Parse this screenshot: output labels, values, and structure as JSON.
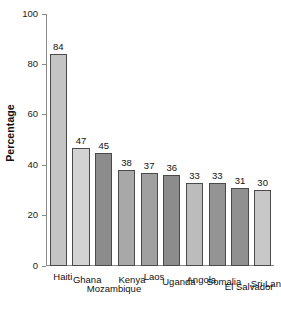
{
  "chart_data": {
    "type": "bar",
    "title": "",
    "xlabel": "",
    "ylabel": "Percentage",
    "ylim": [
      0,
      100
    ],
    "yticks": [
      0,
      20,
      40,
      60,
      80,
      100
    ],
    "ytick_labels": [
      "0",
      "20",
      "40",
      "60",
      "80",
      "100"
    ],
    "grid": false,
    "legend": "none",
    "categories": [
      "Haiti",
      "Ghana",
      "Mozambique",
      "Kenya",
      "Laos",
      "Uganda",
      "Angola",
      "Somalia",
      "El Salvador",
      "Sri Lanka"
    ],
    "values": [
      84,
      47,
      45,
      38,
      37,
      36,
      33,
      33,
      31,
      30
    ],
    "value_labels": [
      "84",
      "47",
      "45",
      "38",
      "37",
      "36",
      "33",
      "33",
      "31",
      "30"
    ],
    "bar_colors": [
      "#c4c4c4",
      "#d3d3d3",
      "#8c8c8c",
      "#a8a8a8",
      "#a0a0a0",
      "#8c8c8c",
      "#bcbcbc",
      "#949494",
      "#909090",
      "#c8c8c8"
    ],
    "bar_outline_color": "#4a4a4a",
    "axis_color": "#8a8a8a",
    "text_color": "#111111",
    "background": "#ffffff"
  }
}
